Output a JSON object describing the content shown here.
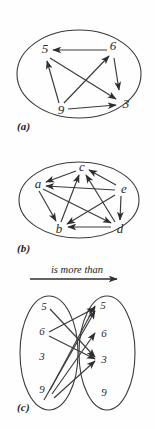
{
  "figure": {
    "title_note": "Three diagrams illustrating the relation 'is more than'",
    "relation_label": "is more than"
  },
  "panels": [
    {
      "id": "a",
      "caption": "(a)",
      "kind": "digraph-single-set",
      "nodes": [
        {
          "id": "n5",
          "label": "5",
          "x": 45,
          "y": 53
        },
        {
          "id": "n6",
          "label": "6",
          "x": 113,
          "y": 50
        },
        {
          "id": "n9",
          "label": "9",
          "x": 61,
          "y": 110
        },
        {
          "id": "n3",
          "label": "3",
          "x": 124,
          "y": 104
        }
      ],
      "edges": [
        {
          "from": "n6",
          "to": "n5"
        },
        {
          "from": "n6",
          "to": "n3"
        },
        {
          "from": "n9",
          "to": "n5"
        },
        {
          "from": "n9",
          "to": "n6"
        },
        {
          "from": "n9",
          "to": "n3"
        },
        {
          "from": "n5",
          "to": "n3"
        }
      ]
    },
    {
      "id": "b",
      "caption": "(b)",
      "kind": "digraph-single-set",
      "nodes": [
        {
          "id": "na",
          "label": "a",
          "x": 38,
          "y": 39
        },
        {
          "id": "nc",
          "label": "c",
          "x": 82,
          "y": 24
        },
        {
          "id": "ne",
          "label": "e",
          "x": 122,
          "y": 44
        },
        {
          "id": "nb",
          "label": "b",
          "x": 60,
          "y": 83
        },
        {
          "id": "nd",
          "label": "d",
          "x": 118,
          "y": 83
        }
      ],
      "edges": [
        {
          "from": "nc",
          "to": "na"
        },
        {
          "from": "ne",
          "to": "na"
        },
        {
          "from": "ne",
          "to": "nc"
        },
        {
          "from": "ne",
          "to": "nd"
        },
        {
          "from": "ne",
          "to": "nb"
        },
        {
          "from": "na",
          "to": "nb"
        },
        {
          "from": "na",
          "to": "nd"
        },
        {
          "from": "nb",
          "to": "nc"
        },
        {
          "from": "nd",
          "to": "nb"
        },
        {
          "from": "nd",
          "to": "nc"
        }
      ]
    },
    {
      "id": "c",
      "caption": "(c)",
      "kind": "bipartite-arrow-diagram",
      "relation_label": "is more than",
      "left_set": {
        "name": "domain",
        "items": [
          {
            "id": "L5",
            "label": "5",
            "x": 44,
            "y": 45
          },
          {
            "id": "L6",
            "label": "6",
            "x": 42,
            "y": 70
          },
          {
            "id": "L3",
            "label": "3",
            "x": 42,
            "y": 95
          },
          {
            "id": "L9",
            "label": "9",
            "x": 42,
            "y": 128
          }
        ]
      },
      "right_set": {
        "name": "codomain",
        "items": [
          {
            "id": "R5",
            "label": "5",
            "x": 101,
            "y": 44
          },
          {
            "id": "R6",
            "label": "6",
            "x": 102,
            "y": 72
          },
          {
            "id": "R3",
            "label": "3",
            "x": 102,
            "y": 98
          },
          {
            "id": "R9",
            "label": "9",
            "x": 102,
            "y": 131
          }
        ]
      },
      "edges": [
        {
          "from": "L5",
          "to": "R3"
        },
        {
          "from": "L6",
          "to": "R5"
        },
        {
          "from": "L6",
          "to": "R3"
        },
        {
          "from": "L9",
          "to": "R5"
        },
        {
          "from": "L9",
          "to": "R6"
        },
        {
          "from": "L9",
          "to": "R3"
        },
        {
          "from": "L9",
          "to": "R5"
        }
      ]
    }
  ]
}
